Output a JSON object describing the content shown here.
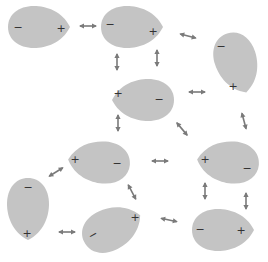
{
  "diagram": {
    "colors": {
      "molecule_fill": "#c4c4c4",
      "arrow": "#7a7a7a",
      "charge_text": "#333333",
      "background": "#ffffff"
    },
    "molecules": [
      {
        "id": "m1",
        "neg": "−",
        "pos": "+"
      },
      {
        "id": "m2",
        "neg": "−",
        "pos": "+"
      },
      {
        "id": "m3",
        "neg": "−",
        "pos": "+"
      },
      {
        "id": "m4",
        "neg": "−",
        "pos": "+"
      },
      {
        "id": "m5",
        "neg": "−",
        "pos": "+"
      },
      {
        "id": "m6",
        "neg": "−",
        "pos": "+"
      },
      {
        "id": "m7",
        "neg": "−",
        "pos": "+"
      },
      {
        "id": "m8",
        "neg": "−",
        "pos": "+"
      },
      {
        "id": "m9",
        "neg": "−",
        "pos": "+"
      }
    ],
    "arrow_count": 15,
    "arrow_type": "double-headed attraction arrow"
  }
}
